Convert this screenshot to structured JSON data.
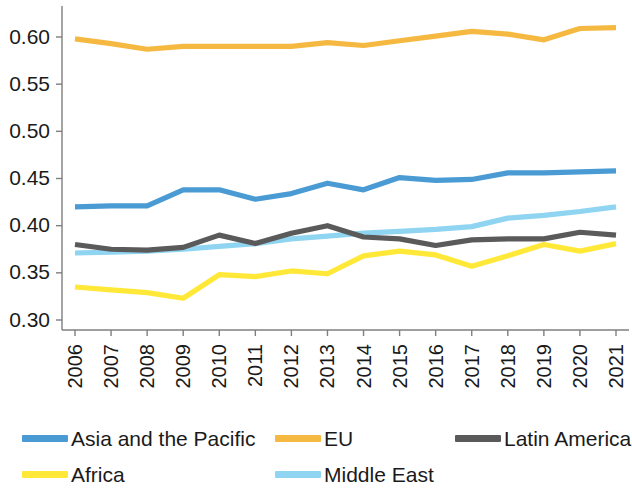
{
  "chart_data": {
    "type": "line",
    "title": "",
    "subtitle": "",
    "xlabel": "",
    "ylabel": "",
    "grid": false,
    "legend_position": "bottom",
    "categories": [
      "2006",
      "2007",
      "2008",
      "2009",
      "2010",
      "2011",
      "2012",
      "2013",
      "2014",
      "2015",
      "2016",
      "2017",
      "2018",
      "2019",
      "2020",
      "2021"
    ],
    "x": [
      2006,
      2007,
      2008,
      2009,
      2010,
      2011,
      2012,
      2013,
      2014,
      2015,
      2016,
      2017,
      2018,
      2019,
      2020,
      2021
    ],
    "xlim": [
      2006,
      2021
    ],
    "ylim": [
      0.3,
      0.615
    ],
    "yticks": [
      0.3,
      0.35,
      0.4,
      0.45,
      0.5,
      0.55,
      0.6
    ],
    "ytick_labels": [
      "0.30",
      "0.35",
      "0.40",
      "0.45",
      "0.50",
      "0.55",
      "0.60"
    ],
    "series": [
      {
        "name": "Asia and the Pacific",
        "color": "#4A9BD4",
        "values": [
          0.42,
          0.421,
          0.421,
          0.438,
          0.438,
          0.428,
          0.434,
          0.445,
          0.438,
          0.451,
          0.448,
          0.449,
          0.456,
          0.456,
          0.457,
          0.458
        ]
      },
      {
        "name": "EU",
        "color": "#F5B942",
        "values": [
          0.598,
          0.593,
          0.587,
          0.59,
          0.59,
          0.59,
          0.59,
          0.594,
          0.591,
          0.596,
          0.601,
          0.606,
          0.603,
          0.597,
          0.609,
          0.61
        ]
      },
      {
        "name": "Latin America",
        "color": "#5A5A5A",
        "values": [
          0.38,
          0.375,
          0.374,
          0.377,
          0.39,
          0.381,
          0.392,
          0.4,
          0.388,
          0.386,
          0.379,
          0.385,
          0.386,
          0.386,
          0.393,
          0.39
        ]
      },
      {
        "name": "Africa",
        "color": "#FFE838",
        "values": [
          0.335,
          0.332,
          0.329,
          0.323,
          0.348,
          0.346,
          0.352,
          0.349,
          0.368,
          0.373,
          0.369,
          0.357,
          0.368,
          0.38,
          0.373,
          0.381
        ]
      },
      {
        "name": "Middle East",
        "color": "#8FD4F0",
        "values": [
          0.371,
          0.372,
          0.373,
          0.375,
          0.378,
          0.381,
          0.386,
          0.389,
          0.392,
          0.394,
          0.396,
          0.399,
          0.408,
          0.411,
          0.415,
          0.42
        ]
      }
    ]
  },
  "legend": {
    "rows": [
      [
        {
          "label": "Asia and the Pacific",
          "color": "#4A9BD4",
          "key": "asia-and-the-pacific"
        },
        {
          "label": "EU",
          "color": "#F5B942",
          "key": "eu"
        },
        {
          "label": "Latin America",
          "color": "#5A5A5A",
          "key": "latin-america"
        }
      ],
      [
        {
          "label": "Africa",
          "color": "#FFE838",
          "key": "africa"
        },
        {
          "label": "Middle East",
          "color": "#8FD4F0",
          "key": "middle-east"
        }
      ]
    ]
  }
}
